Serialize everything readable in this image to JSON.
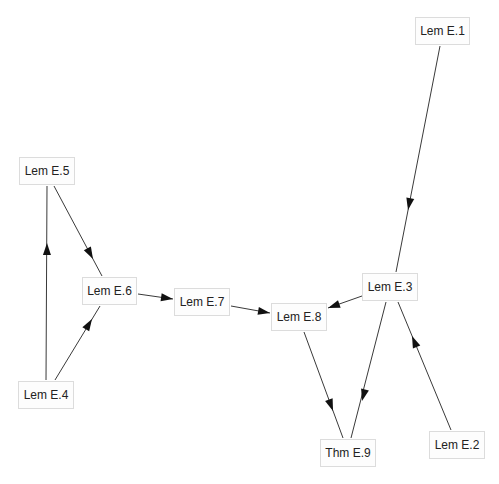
{
  "diagram": {
    "type": "dependency-graph",
    "colors": {
      "background": "#ffffff",
      "node_fill": "#fdfdfd",
      "node_border": "#dcdcdc",
      "edge": "#3a3a3a",
      "text": "#222222"
    },
    "nodes": [
      {
        "id": "E1",
        "label": "Lem E.1",
        "x": 415,
        "y": 17,
        "w": 55,
        "h": 28
      },
      {
        "id": "E5",
        "label": "Lem E.5",
        "x": 19,
        "y": 157,
        "w": 56,
        "h": 28
      },
      {
        "id": "E6",
        "label": "Lem E.6",
        "x": 82,
        "y": 277,
        "w": 55,
        "h": 28
      },
      {
        "id": "E7",
        "label": "Lem E.7",
        "x": 174,
        "y": 288,
        "w": 56,
        "h": 28
      },
      {
        "id": "E8",
        "label": "Lem E.8",
        "x": 271,
        "y": 303,
        "w": 56,
        "h": 28
      },
      {
        "id": "E3",
        "label": "Lem E.3",
        "x": 362,
        "y": 273,
        "w": 56,
        "h": 28
      },
      {
        "id": "E4",
        "label": "Lem E.4",
        "x": 18,
        "y": 381,
        "w": 56,
        "h": 28
      },
      {
        "id": "E9",
        "label": "Thm E.9",
        "x": 320,
        "y": 439,
        "w": 56,
        "h": 28
      },
      {
        "id": "E2",
        "label": "Lem E.2",
        "x": 429,
        "y": 431,
        "w": 56,
        "h": 28
      }
    ],
    "edges": [
      {
        "from": "E1",
        "to": "E3",
        "x1": 440,
        "y1": 46,
        "x2": 396,
        "y2": 272,
        "ax": 408,
        "ay": 210
      },
      {
        "from": "E5",
        "to": "E6",
        "x1": 54,
        "y1": 186,
        "x2": 102,
        "y2": 276,
        "ax": 93,
        "ay": 259
      },
      {
        "from": "E4",
        "to": "E5",
        "x1": 46,
        "y1": 380,
        "x2": 47,
        "y2": 186,
        "ax": 47,
        "ay": 243
      },
      {
        "from": "E4",
        "to": "E6",
        "x1": 55,
        "y1": 380,
        "x2": 100,
        "y2": 306,
        "ax": 92,
        "ay": 319
      },
      {
        "from": "E6",
        "to": "E7",
        "x1": 138,
        "y1": 294,
        "x2": 173,
        "y2": 299,
        "ax": 173,
        "ay": 299
      },
      {
        "from": "E7",
        "to": "E8",
        "x1": 231,
        "y1": 306,
        "x2": 270,
        "y2": 313,
        "ax": 270,
        "ay": 313
      },
      {
        "from": "E3",
        "to": "E8",
        "x1": 362,
        "y1": 296,
        "x2": 328,
        "y2": 308,
        "ax": 328,
        "ay": 308
      },
      {
        "from": "E3",
        "to": "E9",
        "x1": 386,
        "y1": 302,
        "x2": 351,
        "y2": 438,
        "ax": 362,
        "ay": 401
      },
      {
        "from": "E8",
        "to": "E9",
        "x1": 304,
        "y1": 332,
        "x2": 343,
        "y2": 438,
        "ax": 333,
        "ay": 411
      },
      {
        "from": "E2",
        "to": "E3",
        "x1": 451,
        "y1": 430,
        "x2": 398,
        "y2": 302,
        "ax": 412,
        "ay": 336
      }
    ]
  }
}
